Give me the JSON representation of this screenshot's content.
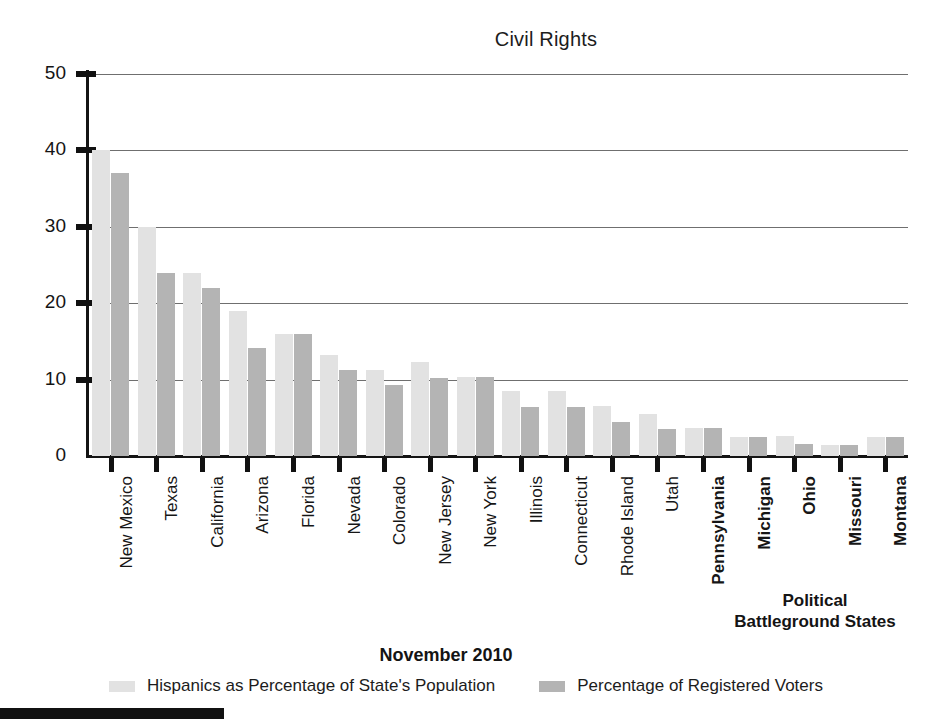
{
  "chart_data": {
    "type": "bar",
    "title": "Civil Rights",
    "xlabel": "",
    "ylabel": "",
    "ylim": [
      0,
      50
    ],
    "yticks": [
      0,
      10,
      20,
      30,
      40,
      50
    ],
    "grid": true,
    "legend_position": "bottom",
    "date_caption": "November 2010",
    "annotation": {
      "line1": "Political",
      "line2": "Battleground States"
    },
    "categories": [
      "New Mexico",
      "Texas",
      "California",
      "Arizona",
      "Florida",
      "Nevada",
      "Colorado",
      "New Jersey",
      "New York",
      "Illinois",
      "Connecticut",
      "Rhode Island",
      "Utah",
      "Pennsylvania",
      "Michigan",
      "Ohio",
      "Missouri",
      "Montana"
    ],
    "battleground_states": [
      "Pennsylvania",
      "Michigan",
      "Ohio",
      "Missouri",
      "Montana"
    ],
    "series": [
      {
        "name": "Hispanics as Percentage of State's Population",
        "color": "#e2e2e2",
        "values": [
          40,
          30,
          24,
          19,
          16,
          13.2,
          11.3,
          12.3,
          10.3,
          8.5,
          8.5,
          6.5,
          5.5,
          3.7,
          2.5,
          2.6,
          1.5,
          2.5
        ]
      },
      {
        "name": "Percentage of Registered Voters",
        "color": "#b4b4b4",
        "values": [
          37,
          24,
          22,
          14.2,
          16,
          11.2,
          9.3,
          10.2,
          10.3,
          6.4,
          6.4,
          4.5,
          3.5,
          3.7,
          2.5,
          1.6,
          1.5,
          2.5
        ]
      }
    ]
  }
}
